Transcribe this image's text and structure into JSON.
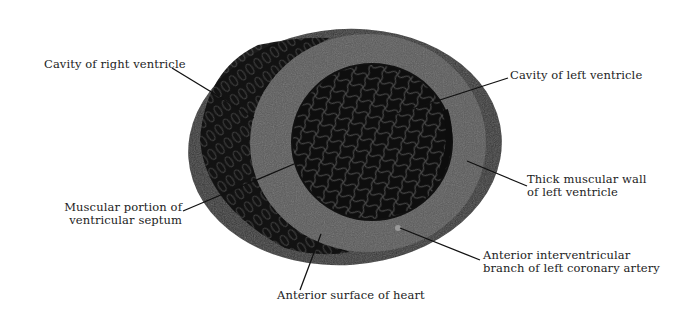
{
  "diagram": {
    "colors": {
      "background": "#ffffff",
      "outer_tissue": "#3a3a3a",
      "septum_wall": "#5a5a5a",
      "cavity": "#0e0e0e",
      "trabeculae": "#4a4a4a",
      "leader_line": "#111111",
      "text": "#1c1c1c"
    },
    "labels": [
      {
        "id": "right-ventricle-cavity",
        "lines": [
          "Cavity of right ventricle"
        ]
      },
      {
        "id": "left-ventricle-cavity",
        "lines": [
          "Cavity of left ventricle"
        ]
      },
      {
        "id": "muscular-septum",
        "lines": [
          "Muscular portion of",
          "ventricular septum"
        ]
      },
      {
        "id": "left-ventricle-wall",
        "lines": [
          "Thick muscular wall",
          "of left ventricle"
        ]
      },
      {
        "id": "anterior-interventricular-branch",
        "lines": [
          "Anterior interventricular",
          "branch of left coronary artery"
        ]
      },
      {
        "id": "anterior-surface",
        "lines": [
          "Anterior surface of heart"
        ]
      }
    ]
  }
}
